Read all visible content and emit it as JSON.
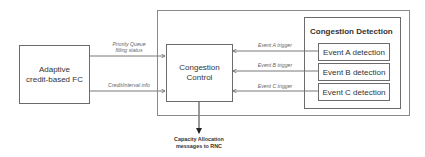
{
  "diagram": {
    "blocks": {
      "adaptive_fc": {
        "line1": "Adaptive",
        "line2": "credit-based FC"
      },
      "congestion_control": {
        "line1": "Congestion",
        "line2": "Control"
      },
      "congestion_detection": {
        "title": "Congestion Detection",
        "events": [
          {
            "label": "Event A detection"
          },
          {
            "label": "Event B detection"
          },
          {
            "label": "Event C detection"
          }
        ]
      }
    },
    "edges": {
      "priority_queue": {
        "line1": "Priority Queue",
        "line2": "filling status"
      },
      "credit_interval": {
        "label": "Credit/interval info"
      },
      "triggers": [
        {
          "label": "Event A trigger"
        },
        {
          "label": "Event B trigger"
        },
        {
          "label": "Event C trigger"
        }
      ]
    },
    "output": {
      "line1": "Capacity Allocation",
      "line2": "messages to RNC"
    }
  }
}
